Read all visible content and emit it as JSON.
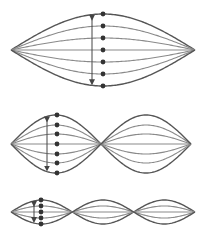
{
  "colors": {
    "background": "#ffffff",
    "string_outer": "#555555",
    "string_inner": "#8a8a8a",
    "dot": "#333333",
    "arrow": "#444444"
  },
  "diagrams": [
    {
      "name": "harmonic-1",
      "x_start": 11,
      "x_end": 195,
      "center_y": 50,
      "loops": 1,
      "amplitudes": [
        36,
        24,
        12,
        0,
        -12,
        -24,
        -36
      ],
      "dots_x": 103,
      "arrow_x": 92
    },
    {
      "name": "harmonic-2",
      "x_start": 11,
      "x_end": 191,
      "center_y": 144,
      "loops": 2,
      "amplitudes": [
        29,
        19,
        10,
        0,
        -10,
        -19,
        -29
      ],
      "dots_x": 57,
      "arrow_x": 47
    },
    {
      "name": "harmonic-3",
      "x_start": 11,
      "x_end": 195,
      "center_y": 212,
      "loops": 3,
      "amplitudes": [
        12,
        6,
        0,
        -6,
        -12
      ],
      "dots_x": 41,
      "arrow_x": 34
    }
  ]
}
